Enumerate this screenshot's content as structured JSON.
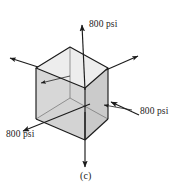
{
  "figure": {
    "caption": "(c)",
    "type": "stress-element-cube-diagram",
    "labels": {
      "top": "800 psi",
      "right": "800 psi",
      "left": "800 psi"
    },
    "colors": {
      "background": "#ffffff",
      "line": "#1b1b1b",
      "face_top": "#e9e9e9",
      "face_left": "#c9c9c9",
      "face_right": "#d9d9d9",
      "face_back": "#f2f2f2",
      "text": "#1b1b1b"
    },
    "geometry": {
      "vertex_top_back": "70,47",
      "vertex_top_left": "36,68",
      "vertex_top_right": "108,68",
      "vertex_top_front": "85,88",
      "vertex_bottom_left": "36,119",
      "vertex_bottom_right": "108,119",
      "vertex_bottom_front": "85,140",
      "vertex_bottom_back": "70,98"
    },
    "arrows": [
      {
        "name": "top-tension-arrow",
        "direction": "up",
        "from": "85,88",
        "to": "82,24"
      },
      {
        "name": "bottom-tension-arrow",
        "direction": "down",
        "from": "85,140",
        "to": "85,168"
      },
      {
        "name": "right-face-arrow",
        "direction": "down-left-into-face",
        "from": "138,114",
        "to": "110,101"
      },
      {
        "name": "left-face-arrow",
        "direction": "down-left-out-of-face",
        "from": "88,104",
        "to": "22,131"
      },
      {
        "name": "rear-right-corner-arrow",
        "direction": "up-right",
        "from": "108,68",
        "to": "138,55"
      },
      {
        "name": "rear-left-corner-arrow",
        "direction": "up-left",
        "from": "36,68",
        "to": "10,58"
      },
      {
        "name": "interior-left-arrow",
        "direction": "left-out",
        "from": "68,77",
        "to": "40,84"
      },
      {
        "name": "interior-right-arrow",
        "direction": "left-into-right-face",
        "from": "118,112",
        "to": "104,106"
      }
    ]
  }
}
